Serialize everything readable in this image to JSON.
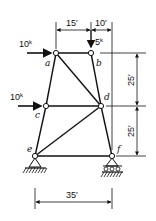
{
  "diagram": {
    "type": "truss",
    "nodes": {
      "a": {
        "label": "a",
        "x": 56,
        "y": 53
      },
      "b": {
        "label": "b",
        "x": 91,
        "y": 53
      },
      "c": {
        "label": "c",
        "x": 46,
        "y": 106
      },
      "d": {
        "label": "d",
        "x": 101,
        "y": 106
      },
      "e": {
        "label": "e",
        "x": 35,
        "y": 156
      },
      "f": {
        "label": "f",
        "x": 112,
        "y": 156
      }
    },
    "members": [
      "a-b",
      "a-c",
      "b-d",
      "a-d",
      "c-d",
      "c-e",
      "d-f",
      "e-d",
      "e-f"
    ],
    "loads": [
      {
        "node": "a",
        "value": "10",
        "unit": "k",
        "direction": "right"
      },
      {
        "node": "c",
        "value": "10",
        "unit": "k",
        "direction": "right"
      },
      {
        "node": "b",
        "value": "5",
        "unit": "k",
        "direction": "down"
      }
    ],
    "supports": [
      {
        "node": "e",
        "type": "pin"
      },
      {
        "node": "f",
        "type": "roller"
      }
    ],
    "dimensions": {
      "top_left": "15′",
      "top_right": "10′",
      "right_upper": "25′",
      "right_lower": "25′",
      "bottom": "35′"
    }
  }
}
